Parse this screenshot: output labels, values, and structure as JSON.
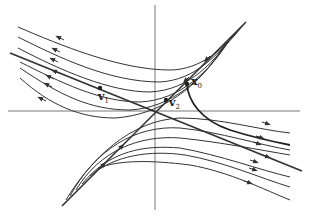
{
  "diagram": {
    "labels": {
      "v1": {
        "base": "v",
        "sub": "1"
      },
      "v2": {
        "base": "v",
        "sub": "2"
      },
      "x0": {
        "base": "x",
        "sub": "0"
      }
    },
    "colors": {
      "line": "#333333",
      "axis": "#444444",
      "background": "#ffffff"
    },
    "axes": {
      "origin": [
        155,
        111
      ],
      "horizontal": [
        8,
        300
      ],
      "vertical": [
        5,
        210
      ]
    },
    "eigenlines": {
      "v1_direction": "unstable (flow away from origin, down-right / up-left)",
      "v2_direction": "stable (flow toward origin along diagonal)"
    }
  }
}
